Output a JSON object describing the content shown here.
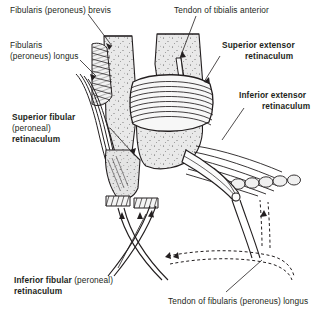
{
  "figure": {
    "background_color": "#ffffff",
    "ink_color": "#231f20",
    "bone_fill_color": "#e8e8e8",
    "tendon_fill_color": "#f2f2f2"
  },
  "labels": {
    "fibularis_brevis": "Fibularis (peroneus) brevis",
    "fibularis_longus_line1": "Fibularis",
    "fibularis_longus_line2": "(peroneus) longus",
    "tendon_tibialis_anterior": "Tendon of tibialis anterior",
    "superior_extensor_line1": "Superior extensor",
    "superior_extensor_line2": "retinaculum",
    "inferior_extensor_line1": "Inferior extensor",
    "inferior_extensor_line2": "retinaculum",
    "superior_fibular_line1": "Superior fibular",
    "superior_fibular_line2": "(peroneal)",
    "superior_fibular_line3": "retinaculum",
    "inferior_fibular_bold1": "Inferior fibular",
    "inferior_fibular_reg": "(peroneal)",
    "inferior_fibular_bold2": "retinaculum",
    "tendon_fibularis_longus": "Tendon of fibularis (peroneus) longus"
  }
}
